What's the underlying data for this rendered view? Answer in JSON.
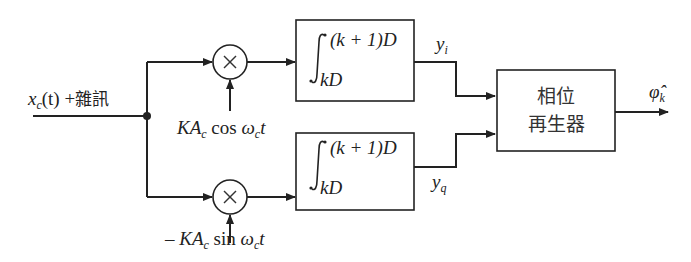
{
  "diagram": {
    "type": "block-diagram",
    "title": "",
    "input": {
      "signal": "x",
      "signal_sub": "c",
      "arg": "(t)",
      "plus": "+",
      "noise_label": "雜訊"
    },
    "branches": [
      {
        "id": "in-phase",
        "multiplier_symbol": "×",
        "reference": {
          "prefix": "",
          "K": "KA",
          "sub": "c",
          "func": "cos",
          "omega": "ω",
          "omega_sub": "c",
          "t": "t"
        },
        "integrator": {
          "upper": "(k + 1)D",
          "lower": "kD"
        },
        "output": {
          "var": "y",
          "sub": "i"
        }
      },
      {
        "id": "quadrature",
        "multiplier_symbol": "×",
        "reference": {
          "prefix": "– ",
          "K": "KA",
          "sub": "c",
          "func": "sin",
          "omega": "ω",
          "omega_sub": "c",
          "t": "t"
        },
        "integrator": {
          "upper": "(k + 1)D",
          "lower": "kD"
        },
        "output": {
          "var": "y",
          "sub": "q"
        }
      }
    ],
    "phase_block": {
      "line1": "相位",
      "line2": "再生器"
    },
    "output": {
      "var": "φ̂",
      "sub": "k"
    },
    "colors": {
      "stroke": "#222222",
      "background": "#ffffff"
    }
  }
}
